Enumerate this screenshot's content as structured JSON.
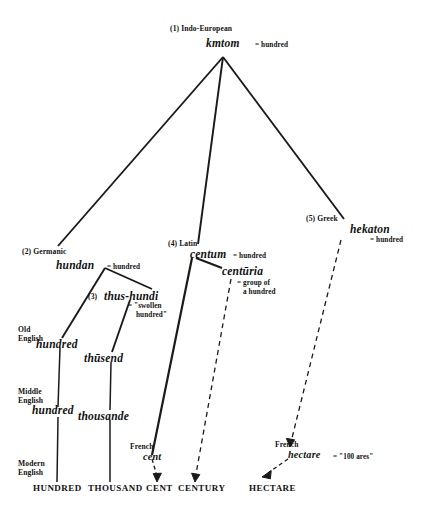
{
  "diagram": {
    "line_color": "#1a1a1a",
    "background": "#ffffff"
  },
  "nodes": {
    "indo_european": {
      "stage": "(1) Indo-European",
      "word": "kmtom",
      "gloss": "= hundred"
    },
    "germanic": {
      "stage": "(2) Germanic",
      "word": "hundan",
      "gloss": "= hundred"
    },
    "thus_hundi": {
      "stage": "(3)",
      "word": "thus-hundi",
      "gloss_line1": "= \"swollen",
      "gloss_line2": "hundred\""
    },
    "latin": {
      "stage": "(4) Latin",
      "word": "centum",
      "gloss": "= hundred"
    },
    "centuria": {
      "word": "centūria",
      "gloss_line1": "= group of",
      "gloss_line2": "a hundred"
    },
    "greek": {
      "stage": "(5) Greek",
      "word": "hekaton",
      "gloss": "= hundred"
    },
    "old_english_hundred": {
      "stage_line1": "Old",
      "stage_line2": "English",
      "word": "hundred"
    },
    "old_english_thusend": {
      "word": "thūsend"
    },
    "middle_english_hundred": {
      "stage_line1": "Middle",
      "stage_line2": "English",
      "word": "hundred"
    },
    "middle_english_thousande": {
      "word": "thousande"
    },
    "french_cent": {
      "stage": "French",
      "word": "cent"
    },
    "french_hectare": {
      "stage": "French",
      "word": "hectare",
      "gloss": "= \"100 ares\""
    },
    "modern_english": {
      "stage_line1": "Modern",
      "stage_line2": "English"
    }
  },
  "outcomes": [
    {
      "label": "HUNDRED"
    },
    {
      "label": "THOUSAND"
    },
    {
      "label": "CENT"
    },
    {
      "label": "CENTURY"
    },
    {
      "label": "HECTARE"
    }
  ]
}
